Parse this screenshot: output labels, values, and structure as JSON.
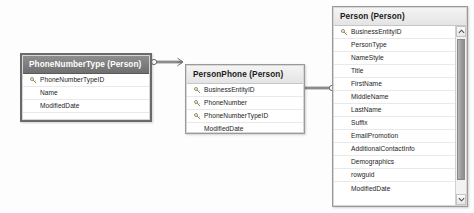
{
  "diagram": {
    "background_color": "#fdfdfd",
    "selected_table": "PhoneNumberType",
    "header_selected_color": "#6f6f6f",
    "header_plain_color": "#e4e4e4",
    "connector_color": "#9c9c9c"
  },
  "tables": [
    {
      "id": "phonenumbertype",
      "title": "PhoneNumberType (Person)",
      "name": "PhoneNumberType",
      "schema": "Person",
      "selected": true,
      "has_scrollbar": false,
      "columns": [
        {
          "name": "PhoneNumberTypeID",
          "key": true
        },
        {
          "name": "Name",
          "key": false
        },
        {
          "name": "ModifiedDate",
          "key": false
        },
        {
          "name": "",
          "key": false
        }
      ]
    },
    {
      "id": "personphone",
      "title": "PersonPhone (Person)",
      "name": "PersonPhone",
      "schema": "Person",
      "selected": false,
      "has_scrollbar": false,
      "columns": [
        {
          "name": "BusinessEntityID",
          "key": true
        },
        {
          "name": "PhoneNumber",
          "key": true
        },
        {
          "name": "PhoneNumberTypeID",
          "key": true
        },
        {
          "name": "ModifiedDate",
          "key": false
        },
        {
          "name": "",
          "key": false
        }
      ]
    },
    {
      "id": "person",
      "title": "Person (Person)",
      "name": "Person",
      "schema": "Person",
      "selected": false,
      "has_scrollbar": true,
      "scrollbar": {
        "up_arrow": "scroll-up-arrow",
        "down_arrow": "scroll-down-arrow"
      },
      "columns": [
        {
          "name": "BusinessEntityID",
          "key": true
        },
        {
          "name": "PersonType",
          "key": false
        },
        {
          "name": "NameStyle",
          "key": false
        },
        {
          "name": "Title",
          "key": false
        },
        {
          "name": "FirstName",
          "key": false
        },
        {
          "name": "MiddleName",
          "key": false
        },
        {
          "name": "LastName",
          "key": false
        },
        {
          "name": "Suffix",
          "key": false
        },
        {
          "name": "EmailPromotion",
          "key": false
        },
        {
          "name": "AdditionalContactInfo",
          "key": false
        },
        {
          "name": "Demographics",
          "key": false
        },
        {
          "name": "rowguid",
          "key": false
        },
        {
          "name": "ModifiedDate",
          "key": false
        }
      ]
    }
  ],
  "relationships": [
    {
      "id": "rel-phonenumbertype-personphone",
      "from_table": "PhoneNumberType",
      "to_table": "PersonPhone",
      "from_cardinality": "one",
      "to_cardinality": "many"
    },
    {
      "id": "rel-personphone-person",
      "from_table": "PersonPhone",
      "to_table": "Person",
      "from_cardinality": "many",
      "to_cardinality": "one"
    }
  ],
  "icons": {
    "primary_key": "key-icon",
    "one_cardinality": "circle-endpoint-icon",
    "many_cardinality": "crowsfoot-endpoint-icon"
  }
}
